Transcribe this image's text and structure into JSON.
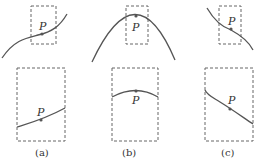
{
  "figure": {
    "point_label": "P",
    "panels": [
      {
        "id": "a",
        "caption": "(a)",
        "description": "increasing curve; local zoom appears nearly straight, rising"
      },
      {
        "id": "b",
        "caption": "(b)",
        "description": "parabola peak; local zoom shows slight arc with P at top"
      },
      {
        "id": "c",
        "caption": "(c)",
        "description": "decreasing curve; local zoom appears nearly straight, falling"
      }
    ]
  },
  "colors": {
    "stroke": "#555555",
    "box": "#666666",
    "background": "#ffffff"
  }
}
